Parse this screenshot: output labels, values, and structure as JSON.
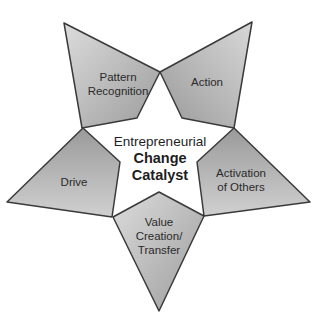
{
  "diagram": {
    "center": {
      "line1": "Entrepreneurial",
      "line2": "Change",
      "line3": "Catalyst"
    },
    "segments": [
      {
        "id": "pattern-recognition",
        "lines": [
          "Pattern",
          "Recognition"
        ]
      },
      {
        "id": "action",
        "lines": [
          "Action"
        ]
      },
      {
        "id": "activation-of-others",
        "lines": [
          "Activation",
          "of Others"
        ]
      },
      {
        "id": "value-creation-transfer",
        "lines": [
          "Value",
          "Creation/",
          "Transfer"
        ]
      },
      {
        "id": "drive",
        "lines": [
          "Drive"
        ]
      }
    ],
    "colors": {
      "fill_light": "#d4d4d4",
      "fill_dark": "#9a9a9a",
      "stroke": "#3a3a3a",
      "center": "#ffffff"
    }
  }
}
